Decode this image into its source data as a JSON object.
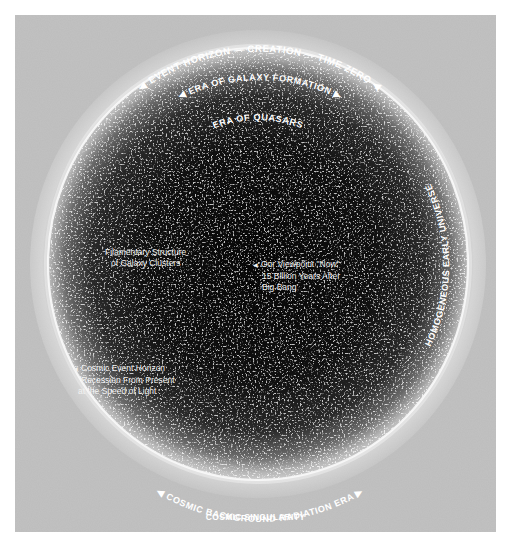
{
  "diagram": {
    "colors": {
      "background": "#ffffff",
      "panel": "#b9b9b9",
      "universe_core": "#080808",
      "universe_edge": "#9a9a9a",
      "ring": "#f4f4f4",
      "text": "#ffffff"
    },
    "arc_labels": {
      "event_horizon": "◀ EVENT HORIZON — CREATION — TIME ZERO ◀",
      "galaxy_formation": "◀ ERA OF GALAXY FORMATION ▶",
      "quasars": "ERA OF QUASARS",
      "homogeneous": "HOMOGENEOUS EARLY UNIVERSE",
      "background_radiation": "◀ COSMIC BACKGROUND RADIATION ERA ▶"
    },
    "annotations": {
      "filamentary": {
        "lines": [
          "Filamentary Structure",
          "of Galaxy Clusters"
        ]
      },
      "viewpoint": {
        "lines": [
          "Our Viewpoint \"Now\"",
          "15 Billion Years After",
          "Big Bang"
        ]
      },
      "cosmic_event_horizon": {
        "lines": [
          "Cosmic Event Horizon",
          "Recession From Present",
          "at the Speed of Light"
        ]
      }
    },
    "bottom_label": "COSMIC SINGULARITY"
  }
}
